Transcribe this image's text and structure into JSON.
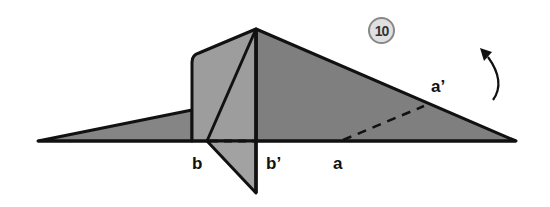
{
  "step": {
    "number": "10"
  },
  "labels": {
    "b": "b",
    "b_prime": "b’",
    "a": "a",
    "a_prime": "a’"
  },
  "colors": {
    "fill_light": "#9c9c9c",
    "fill_mid": "#8a8a8a",
    "fill_dark": "#7e7e7e",
    "stroke": "#111111"
  },
  "arrow": {
    "direction": "fold-up",
    "icon": "curved-arrow-up-icon"
  }
}
